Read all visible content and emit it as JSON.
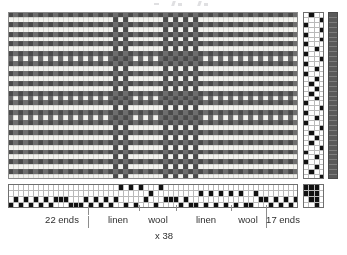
{
  "document": {
    "kind": "weaving-draft",
    "description": "Woven fabric drawdown with threading, tie-up, treadling and warp/weft colour bars"
  },
  "colors": {
    "dark_yarn": "#4a4a4a",
    "light_yarn": "#f2f2ee",
    "mid_yarn": "#6d6d6d",
    "grid_line": "#b9b9b9",
    "filled_cell": "#111111",
    "empty_cell": "#ffffff",
    "tick_line": "#8d8d8d",
    "text": "#2f2f2f",
    "weft_bar": "#5a5a5a",
    "background": "#ffffff"
  },
  "drawdown": {
    "name": "drawdown",
    "columns": 58,
    "rows": 34,
    "warp_sequence_label": "dark / light alternating check",
    "weft_sequence_label": "dark / light alternating check"
  },
  "treadling": {
    "name": "treadling",
    "columns": 4,
    "rows": 34
  },
  "weft_color_bar": {
    "name": "weft-colour-bar",
    "rows": 34,
    "swatch_color": "#5a5a5a"
  },
  "threading": {
    "name": "threading",
    "columns": 58,
    "rows": 4
  },
  "tieup": {
    "name": "tie-up",
    "columns": 4,
    "rows": 4,
    "pattern": [
      [
        1,
        1,
        1,
        0
      ],
      [
        1,
        1,
        1,
        0
      ],
      [
        0,
        1,
        1,
        0
      ],
      [
        0,
        0,
        1,
        0
      ]
    ]
  },
  "annotations": {
    "segments": [
      {
        "label": "22 ends",
        "center_x": 62
      },
      {
        "label": "linen",
        "center_x": 118
      },
      {
        "label": "wool",
        "center_x": 158
      },
      {
        "label": "linen",
        "center_x": 206
      },
      {
        "label": "wool",
        "center_x": 248
      },
      {
        "label": "17 ends",
        "center_x": 283
      }
    ],
    "ticks": [
      {
        "x": 88,
        "y": 0,
        "height": 10
      },
      {
        "x": 139,
        "y": 0,
        "height": 6
      },
      {
        "x": 176,
        "y": 0,
        "height": 6
      },
      {
        "x": 231,
        "y": 0,
        "height": 6
      },
      {
        "x": 266,
        "y": 0,
        "height": 23
      },
      {
        "x": 88,
        "y": 11,
        "height": 12
      }
    ],
    "repeat": {
      "label": "x 38",
      "x": 155,
      "y": 25
    }
  }
}
